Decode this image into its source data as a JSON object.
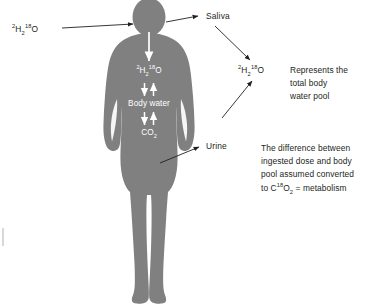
{
  "diagram": {
    "background_color": "#ffffff",
    "silhouette_color": "#808080",
    "text_color": "#231f20",
    "inner_label_color": "#ffffff",
    "arrow_color": "#231f20",
    "inner_arrow_color": "#ffffff"
  },
  "labels": {
    "dose_input": {
      "prefix_sup": "2",
      "element_h": "H",
      "sub_2": "2",
      "iso_sup": "18",
      "element_o": "O",
      "plain": "2H2 18O"
    },
    "saliva": "Saliva",
    "urine": "Urine",
    "pool_marker": {
      "prefix_sup": "2",
      "element_h": "H",
      "sub_2": "2",
      "iso_sup": "18",
      "element_o": "O",
      "plain": "2H2 18O"
    }
  },
  "body_chain": {
    "top_label": {
      "prefix_sup": "2",
      "element_h": "H",
      "sub_2": "2",
      "iso_sup": "18",
      "element_o": "O",
      "plain": "2H2 18O"
    },
    "middle_label": "Body water",
    "bottom_label": {
      "element": "CO",
      "sub": "2",
      "plain": "CO2"
    }
  },
  "annotations": {
    "pool_note": {
      "lines": [
        "Represents the",
        "total body",
        "water pool"
      ]
    },
    "metabolism_note": {
      "line1": "The difference between",
      "line2": "ingested dose and body",
      "line3": "pool assumed converted",
      "line4_prefix": "to C",
      "line4_sup": "18",
      "line4_element": "O",
      "line4_sub": "2",
      "line4_suffix": " = metabolism"
    }
  }
}
